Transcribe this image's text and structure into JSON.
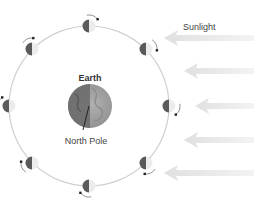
{
  "labels": {
    "earth": "Earth",
    "north_pole": "North Pole",
    "sunlight": "Sunlight"
  },
  "colors": {
    "orbit": "#cfcfcf",
    "moon_dark": "#5a5a5a",
    "moon_light": "#ececec",
    "earth_dark": "#6e6e6e",
    "earth_light": "#a8a8a8",
    "arrow": "#e3e3e3",
    "text": "#333333",
    "rotation_arrow": "#555555"
  },
  "orbit": {
    "cx": 89,
    "cy": 106,
    "r": 80
  },
  "earth": {
    "cx": 90,
    "cy": 106,
    "r": 22
  },
  "moons": [
    {
      "name": "moon-top",
      "cx": 89,
      "cy": 26
    },
    {
      "name": "moon-top-right",
      "cx": 146,
      "cy": 49
    },
    {
      "name": "moon-right",
      "cx": 169,
      "cy": 106
    },
    {
      "name": "moon-bottom-right",
      "cx": 146,
      "cy": 163
    },
    {
      "name": "moon-bottom",
      "cx": 89,
      "cy": 186
    },
    {
      "name": "moon-bottom-left",
      "cx": 32,
      "cy": 163
    },
    {
      "name": "moon-left",
      "cx": 9,
      "cy": 106
    },
    {
      "name": "moon-top-left",
      "cx": 32,
      "cy": 49
    }
  ],
  "sun_arrows": [
    {
      "y": 38,
      "x_tip": 164
    },
    {
      "y": 71,
      "x_tip": 184
    },
    {
      "y": 106,
      "x_tip": 195
    },
    {
      "y": 140,
      "x_tip": 184
    },
    {
      "y": 173,
      "x_tip": 164
    }
  ]
}
